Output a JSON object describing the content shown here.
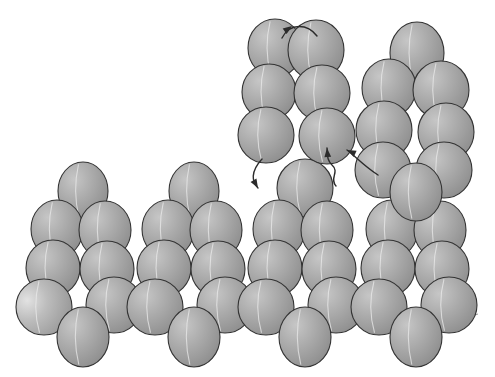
{
  "figure": {
    "canvas": {
      "width": 495,
      "height": 377
    },
    "background_color": "#ffffff"
  },
  "style": {
    "sphere_fill_light": "#b9b9b9",
    "sphere_fill_mid": "#a3a3a3",
    "sphere_fill_dark": "#8d8d8d",
    "sphere_highlight": "#d8d8d8",
    "sphere_outline": "#333333",
    "seam_color": "#e9e9e9",
    "bond_color": "#9a9a9a",
    "arrow_color": "#2b2b2b",
    "sphere_rx": 27,
    "sphere_ry": 30
  },
  "clusters": [
    {
      "name": "bottom-cluster-1",
      "label": "Pyramid cluster 1",
      "spheres": [
        {
          "id": "b1-apex",
          "cx": 83,
          "cy": 191,
          "rx": 25,
          "ry": 29,
          "shade": "mid"
        },
        {
          "id": "b1-upper-left",
          "cx": 57,
          "cy": 229,
          "rx": 26,
          "ry": 29,
          "shade": "mid"
        },
        {
          "id": "b1-upper-right",
          "cx": 105,
          "cy": 230,
          "rx": 26,
          "ry": 29,
          "shade": "mid"
        },
        {
          "id": "b1-mid-left",
          "cx": 53,
          "cy": 268,
          "rx": 27,
          "ry": 28,
          "shade": "mid"
        },
        {
          "id": "b1-mid-right",
          "cx": 107,
          "cy": 269,
          "rx": 27,
          "ry": 28,
          "shade": "mid"
        },
        {
          "id": "b1-low-left",
          "cx": 44,
          "cy": 307,
          "rx": 28,
          "ry": 28,
          "shade": "light"
        },
        {
          "id": "b1-low-right",
          "cx": 114,
          "cy": 305,
          "rx": 28,
          "ry": 28,
          "shade": "mid"
        },
        {
          "id": "b1-base",
          "cx": 83,
          "cy": 337,
          "rx": 26,
          "ry": 30,
          "shade": "mid"
        }
      ]
    },
    {
      "name": "bottom-cluster-2",
      "label": "Pyramid cluster 2",
      "spheres": [
        {
          "id": "b2-apex",
          "cx": 194,
          "cy": 191,
          "rx": 25,
          "ry": 29,
          "shade": "mid"
        },
        {
          "id": "b2-upper-left",
          "cx": 168,
          "cy": 229,
          "rx": 26,
          "ry": 29,
          "shade": "mid"
        },
        {
          "id": "b2-upper-right",
          "cx": 216,
          "cy": 230,
          "rx": 26,
          "ry": 29,
          "shade": "mid"
        },
        {
          "id": "b2-mid-left",
          "cx": 164,
          "cy": 268,
          "rx": 27,
          "ry": 28,
          "shade": "mid"
        },
        {
          "id": "b2-mid-right",
          "cx": 218,
          "cy": 269,
          "rx": 27,
          "ry": 28,
          "shade": "mid"
        },
        {
          "id": "b2-low-left",
          "cx": 155,
          "cy": 307,
          "rx": 28,
          "ry": 28,
          "shade": "mid"
        },
        {
          "id": "b2-low-right",
          "cx": 225,
          "cy": 305,
          "rx": 28,
          "ry": 28,
          "shade": "mid"
        },
        {
          "id": "b2-base",
          "cx": 194,
          "cy": 337,
          "rx": 26,
          "ry": 30,
          "shade": "mid"
        }
      ]
    },
    {
      "name": "bottom-cluster-3",
      "label": "Pyramid cluster 3",
      "spheres": [
        {
          "id": "b3-apex",
          "cx": 305,
          "cy": 188,
          "rx": 28,
          "ry": 29,
          "shade": "mid"
        },
        {
          "id": "b3-upper-left",
          "cx": 279,
          "cy": 229,
          "rx": 26,
          "ry": 29,
          "shade": "mid"
        },
        {
          "id": "b3-upper-right",
          "cx": 327,
          "cy": 230,
          "rx": 26,
          "ry": 29,
          "shade": "mid"
        },
        {
          "id": "b3-mid-left",
          "cx": 275,
          "cy": 268,
          "rx": 27,
          "ry": 28,
          "shade": "mid"
        },
        {
          "id": "b3-mid-right",
          "cx": 329,
          "cy": 269,
          "rx": 27,
          "ry": 28,
          "shade": "mid"
        },
        {
          "id": "b3-low-left",
          "cx": 266,
          "cy": 307,
          "rx": 28,
          "ry": 28,
          "shade": "mid"
        },
        {
          "id": "b3-low-right",
          "cx": 336,
          "cy": 305,
          "rx": 28,
          "ry": 28,
          "shade": "mid"
        },
        {
          "id": "b3-base",
          "cx": 305,
          "cy": 337,
          "rx": 26,
          "ry": 30,
          "shade": "mid"
        }
      ]
    },
    {
      "name": "bottom-cluster-4",
      "label": "Pyramid cluster 4",
      "spheres": [
        {
          "id": "b4-upper-left",
          "cx": 392,
          "cy": 229,
          "rx": 26,
          "ry": 29,
          "shade": "mid"
        },
        {
          "id": "b4-upper-right",
          "cx": 440,
          "cy": 230,
          "rx": 26,
          "ry": 29,
          "shade": "mid"
        },
        {
          "id": "b4-mid-left",
          "cx": 388,
          "cy": 268,
          "rx": 27,
          "ry": 28,
          "shade": "mid"
        },
        {
          "id": "b4-mid-right",
          "cx": 442,
          "cy": 269,
          "rx": 27,
          "ry": 28,
          "shade": "mid"
        },
        {
          "id": "b4-low-left",
          "cx": 379,
          "cy": 307,
          "rx": 28,
          "ry": 28,
          "shade": "mid"
        },
        {
          "id": "b4-low-right",
          "cx": 449,
          "cy": 305,
          "rx": 28,
          "ry": 28,
          "shade": "mid"
        },
        {
          "id": "b4-base",
          "cx": 416,
          "cy": 337,
          "rx": 26,
          "ry": 30,
          "shade": "mid"
        }
      ]
    },
    {
      "name": "top-center-cluster",
      "label": "Detached six-sphere ring cluster",
      "spheres": [
        {
          "id": "t-upper-left",
          "cx": 275,
          "cy": 48,
          "rx": 27,
          "ry": 29,
          "shade": "mid"
        },
        {
          "id": "t-upper-right",
          "cx": 316,
          "cy": 50,
          "rx": 28,
          "ry": 30,
          "shade": "mid"
        },
        {
          "id": "t-mid-left",
          "cx": 269,
          "cy": 92,
          "rx": 27,
          "ry": 28,
          "shade": "mid"
        },
        {
          "id": "t-mid-right",
          "cx": 322,
          "cy": 93,
          "rx": 28,
          "ry": 28,
          "shade": "mid"
        },
        {
          "id": "t-low-left",
          "cx": 266,
          "cy": 135,
          "rx": 28,
          "ry": 28,
          "shade": "mid"
        },
        {
          "id": "t-low-right",
          "cx": 327,
          "cy": 136,
          "rx": 28,
          "ry": 28,
          "shade": "mid"
        }
      ]
    },
    {
      "name": "right-tall-cluster",
      "label": "Tall right-side cluster",
      "spheres": [
        {
          "id": "r-apex",
          "cx": 417,
          "cy": 53,
          "rx": 27,
          "ry": 31,
          "shade": "mid"
        },
        {
          "id": "r-upper-left",
          "cx": 389,
          "cy": 88,
          "rx": 27,
          "ry": 29,
          "shade": "mid"
        },
        {
          "id": "r-upper-right",
          "cx": 441,
          "cy": 90,
          "rx": 28,
          "ry": 29,
          "shade": "mid"
        },
        {
          "id": "r-mid-left",
          "cx": 384,
          "cy": 130,
          "rx": 28,
          "ry": 29,
          "shade": "mid"
        },
        {
          "id": "r-mid-right",
          "cx": 446,
          "cy": 132,
          "rx": 28,
          "ry": 29,
          "shade": "mid"
        },
        {
          "id": "r-low-left",
          "cx": 383,
          "cy": 170,
          "rx": 28,
          "ry": 28,
          "shade": "mid"
        },
        {
          "id": "r-low-right",
          "cx": 444,
          "cy": 170,
          "rx": 28,
          "ry": 28,
          "shade": "mid"
        },
        {
          "id": "r-base",
          "cx": 416,
          "cy": 192,
          "rx": 26,
          "ry": 29,
          "shade": "mid"
        }
      ]
    }
  ],
  "bonds": [
    {
      "id": "bond-base-1",
      "d": "M 28 312 L 62 326 L 83 331 L 110 324 L 150 314"
    },
    {
      "id": "bond-base-2",
      "d": "M 150 314 L 173 327 L 194 331 L 221 324 L 261 314"
    },
    {
      "id": "bond-base-3",
      "d": "M 261 314 L 284 327 L 305 331 L 332 324 L 372 314"
    },
    {
      "id": "bond-base-4",
      "d": "M 372 314 L 395 327 L 416 331 L 443 324 L 478 314"
    }
  ],
  "arrows": [
    {
      "id": "arrow-top-arc",
      "label": "Short arc over top pair",
      "path": "M 282 38 C 290 22 308 24 317 36",
      "head": {
        "x": 292,
        "y": 26,
        "angle": -35
      }
    },
    {
      "id": "arrow-left-descend",
      "label": "Curve from lower-left sphere down to apex sphere",
      "path": "M 262 159 C 250 172 252 182 258 188",
      "head": {
        "x": 258,
        "y": 188,
        "angle": 60
      }
    },
    {
      "id": "arrow-squiggle-up",
      "label": "S-shaped squiggle arrow pointing up",
      "path": "M 336 186 C 329 178 340 172 332 165 C 326 159 328 154 327 148",
      "head": {
        "x": 327,
        "y": 148,
        "angle": -95
      }
    },
    {
      "id": "arrow-right-incoming",
      "label": "Arrow from right cluster curving left",
      "path": "M 378 175 C 364 166 354 155 347 150",
      "head": {
        "x": 347,
        "y": 150,
        "angle": -155
      }
    }
  ]
}
